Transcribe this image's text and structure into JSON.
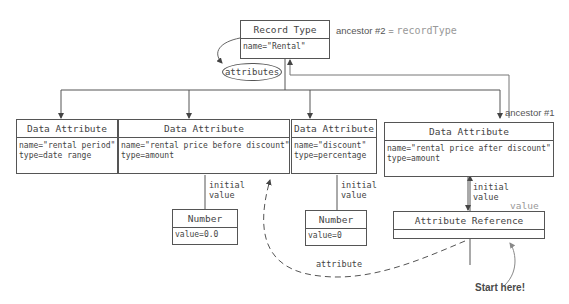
{
  "record_type": {
    "header": "Record Type",
    "body": "name=\"Rental\"",
    "ancestor_label": "ancestor #2 = ",
    "ancestor_value": "recordType"
  },
  "attributes_oval": "attributes",
  "data_attributes": [
    {
      "header": "Data Attribute",
      "body": "name=\"rental period\"\ntype=date range"
    },
    {
      "header": "Data Attribute",
      "body": "name=\"rental price before discount\"\ntype=amount"
    },
    {
      "header": "Data Attribute",
      "body": "name=\"discount\"\ntype=percentage"
    },
    {
      "header": "Data Attribute",
      "body": "name=\"rental price after discount\"\ntype=amount"
    }
  ],
  "ancestor_1": "ancestor #1",
  "initial_value_label": "initial\nvalue",
  "numbers": [
    {
      "header": "Number",
      "body": "value=0.0"
    },
    {
      "header": "Number",
      "body": "value=0"
    }
  ],
  "attribute_reference": {
    "header": "Attribute Reference",
    "value_label": "value"
  },
  "attribute_edge_label": "attribute",
  "start_here": "Start here!",
  "colors": {
    "line": "#555555",
    "gray_text": "#999999",
    "text": "#444444"
  }
}
